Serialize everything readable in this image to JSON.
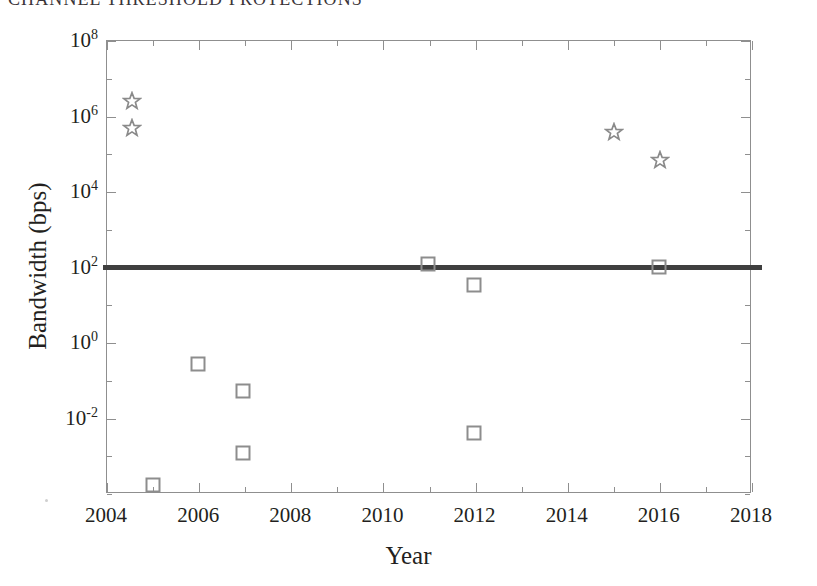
{
  "running_head": {
    "text": "CHANNEL THRESHOLD PROTECTIONS"
  },
  "figure": {
    "x_axis_title": "Year",
    "y_axis_title": "Bandwidth (bps)"
  },
  "axis": {
    "x_tick_labels": [
      "2004",
      "2006",
      "2008",
      "2010",
      "2012",
      "2014",
      "2016",
      "2018"
    ],
    "y_tick_labels": [
      {
        "mantissa": "10",
        "exponent": "8"
      },
      {
        "mantissa": "10",
        "exponent": "6"
      },
      {
        "mantissa": "10",
        "exponent": "4"
      },
      {
        "mantissa": "10",
        "exponent": "2"
      },
      {
        "mantissa": "10",
        "exponent": "0"
      },
      {
        "mantissa": "10",
        "exponent": "-2"
      }
    ]
  },
  "colors": {
    "marker_square": "#8d8d8d",
    "marker_star": "#8a8a8a",
    "threshold_line": "#3f3f3f",
    "axis": "#8f8f8f",
    "text": "#231f20"
  },
  "chart_data": {
    "type": "scatter",
    "title": "",
    "subtitle": "",
    "xlabel": "Year",
    "ylabel": "Bandwidth (bps)",
    "xlim": [
      2004,
      2018
    ],
    "ylim": [
      0.0001,
      100000000
    ],
    "yscale": "log",
    "xscale": "linear",
    "grid": false,
    "legend": false,
    "legend_position": "none",
    "x_ticks": [
      2004,
      2006,
      2008,
      2010,
      2012,
      2014,
      2016,
      2018
    ],
    "y_ticks": [
      0.01,
      1,
      100,
      10000,
      1000000,
      100000000
    ],
    "y_tick_labels": [
      "10^-2",
      "10^0",
      "10^2",
      "10^4",
      "10^6",
      "10^8"
    ],
    "series": [
      {
        "name": "star-series",
        "marker": "star",
        "color": "#8a8a8a",
        "filled": false,
        "points": [
          {
            "x": 2005,
            "y": 3000000
          },
          {
            "x": 2005,
            "y": 800000
          },
          {
            "x": 2015,
            "y": 500000
          },
          {
            "x": 2016,
            "y": 100000
          }
        ]
      },
      {
        "name": "square-series",
        "marker": "square",
        "color": "#8d8d8d",
        "filled": false,
        "points": [
          {
            "x": 2005,
            "y": 0.001
          },
          {
            "x": 2006,
            "y": 1.0
          },
          {
            "x": 2007,
            "y": 0.2
          },
          {
            "x": 2007,
            "y": 0.006
          },
          {
            "x": 2011,
            "y": 300
          },
          {
            "x": 2012,
            "y": 100
          },
          {
            "x": 2012,
            "y": 0.02
          },
          {
            "x": 2016,
            "y": 250
          }
        ]
      }
    ],
    "annotations": [
      {
        "type": "hline",
        "name": "threshold-line",
        "y": 100,
        "label": "",
        "color": "#3f3f3f",
        "linewidth": 5
      }
    ]
  },
  "plot_geometry": {
    "left": 106,
    "top": 40,
    "width": 645,
    "height": 453,
    "x_px": {
      "2004": 106,
      "2006": 198,
      "2008": 290,
      "2010": 382,
      "2012": 474,
      "2014": 566,
      "2016": 658,
      "2018": 751
    },
    "y_px": {
      "1e8": 40,
      "1e6": 124,
      "1e4": 205,
      "1e2": 284,
      "1e0": 366,
      "1e-2": 448
    },
    "markers": [
      {
        "series": "star",
        "cx": 131,
        "cy": 100
      },
      {
        "series": "star",
        "cx": 131,
        "cy": 127
      },
      {
        "series": "star",
        "cx": 613,
        "cy": 131
      },
      {
        "series": "star",
        "cx": 659,
        "cy": 159
      },
      {
        "series": "square",
        "cx": 152,
        "cy": 484
      },
      {
        "series": "square",
        "cx": 197,
        "cy": 363
      },
      {
        "series": "square",
        "cx": 242,
        "cy": 390
      },
      {
        "series": "square",
        "cx": 242,
        "cy": 452
      },
      {
        "series": "square",
        "cx": 427,
        "cy": 263
      },
      {
        "series": "square",
        "cx": 473,
        "cy": 284
      },
      {
        "series": "square",
        "cx": 473,
        "cy": 432
      },
      {
        "series": "square",
        "cx": 658,
        "cy": 266
      }
    ]
  }
}
